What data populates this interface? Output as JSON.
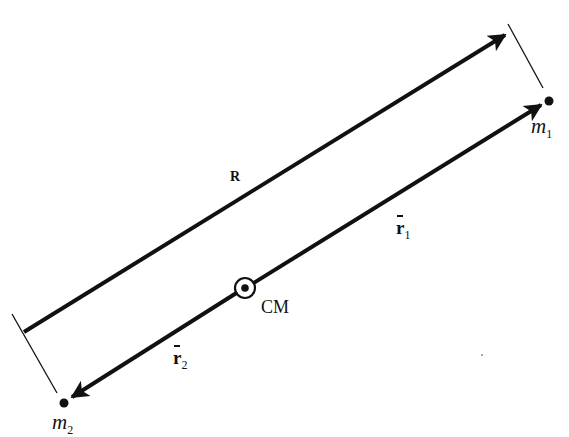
{
  "diagram": {
    "type": "two-body center-of-mass vector diagram",
    "colors": {
      "ink": "#111111",
      "background": "#ffffff"
    },
    "labels": {
      "R": "R",
      "r1": {
        "base": "r",
        "sub": "1"
      },
      "r2": {
        "base": "r",
        "sub": "2"
      },
      "cm": "CM",
      "m1": {
        "base": "m",
        "sub": "1"
      },
      "m2": {
        "base": "m",
        "sub": "2"
      }
    },
    "elements": {
      "R_vector": {
        "from": [
          24,
          332
        ],
        "to": [
          507,
          34
        ]
      },
      "r1_vector": {
        "from": [
          245,
          288
        ],
        "to": [
          543,
          104
        ]
      },
      "r2_vector": {
        "from": [
          245,
          288
        ],
        "to": [
          70,
          398
        ]
      },
      "tick_m1": {
        "from": [
          508,
          24
        ],
        "to": [
          543,
          88
        ]
      },
      "tick_m2": {
        "from": [
          12,
          314
        ],
        "to": [
          57,
          393
        ]
      },
      "mass_m1": [
        549,
        101
      ],
      "mass_m2": [
        64,
        403
      ],
      "center_of_mass": [
        245,
        288
      ]
    }
  }
}
